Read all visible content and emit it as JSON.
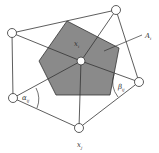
{
  "diagram": {
    "title": "",
    "colors": {
      "background": "#ffffff",
      "cell_fill": "#8a8a8a",
      "stroke": "#333333",
      "node_fill": "#ffffff"
    },
    "center_node": {
      "id": "x_i",
      "x": 81,
      "y": 61
    },
    "neighbors": [
      {
        "id": "n1",
        "x": 116,
        "y": 10
      },
      {
        "id": "n2",
        "x": 139,
        "y": 82
      },
      {
        "id": "x_j",
        "x": 79,
        "y": 128
      },
      {
        "id": "n4",
        "x": 13,
        "y": 98
      },
      {
        "id": "n5",
        "x": 12,
        "y": 33
      }
    ],
    "voronoi_cell": {
      "label": "A_i",
      "points": "67,21 119,48 110,95 56,95 39,61"
    },
    "labels": {
      "xi_main": "x",
      "xi_sub": "i",
      "Ai_main": "A",
      "Ai_sub": "i",
      "alpha_main": "α",
      "alpha_sub": "ij",
      "beta_main": "β",
      "beta_sub": "ij",
      "xj_main": "x",
      "xj_sub": "j"
    }
  }
}
